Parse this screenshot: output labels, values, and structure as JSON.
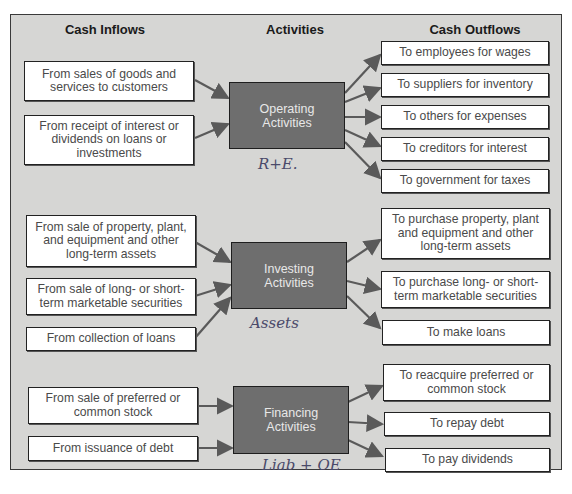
{
  "headers": {
    "inflows": "Cash Inflows",
    "activities": "Activities",
    "outflows": "Cash Outflows"
  },
  "operating": {
    "label": "Operating Activities",
    "label_line1": "Operating",
    "label_line2": "Activities",
    "note": "R+E.",
    "inflows": [
      "From sales of goods and services to customers",
      "From receipt of interest or dividends on loans or investments"
    ],
    "outflows": [
      "To employees for wages",
      "To suppliers for inventory",
      "To others for expenses",
      "To creditors for interest",
      "To government for taxes"
    ]
  },
  "investing": {
    "label": "Investing Activities",
    "label_line1": "Investing",
    "label_line2": "Activities",
    "note": "Assets",
    "inflows": [
      "From sale of property, plant, and equipment and other long-term assets",
      "From sale of long- or short-term marketable securities",
      "From collection of loans"
    ],
    "outflows": [
      "To purchase property, plant and equipment and other long-term assets",
      "To purchase long- or short-term marketable securities",
      "To make loans"
    ]
  },
  "financing": {
    "label": "Financing Activities",
    "label_line1": "Financing",
    "label_line2": "Activities",
    "note": "Liab + OE",
    "inflows": [
      "From sale of preferred or common stock",
      "From issuance of debt"
    ],
    "outflows": [
      "To reacquire preferred or common stock",
      "To repay debt",
      "To pay dividends"
    ]
  },
  "colors": {
    "background": "#d6d6d4",
    "activity_box": "#6e6e6e",
    "arrow": "#5a5a5a",
    "box_text": "#4a4a4a"
  }
}
